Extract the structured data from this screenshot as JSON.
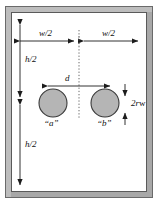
{
  "figure": {
    "name": "well-doublet-domain-diagram",
    "background_color": "#ffffff"
  },
  "frame": {
    "name": "outer-rectangular-boundary",
    "band_color": "#a8a8a8",
    "band_highlight": "#c9c9c9",
    "outline_color": "#4a4a4a",
    "interior_color": "#ffffff"
  },
  "centerline": {
    "name": "vertical-symmetry-axis",
    "style": "dotted",
    "color": "#6b6b6b"
  },
  "wells": [
    {
      "id": "a",
      "label": "“a”",
      "fill": "#b5b5b5",
      "stroke": "#3a3a3a",
      "cx": 53,
      "cy": 103,
      "r": 14
    },
    {
      "id": "b",
      "label": "“b”",
      "fill": "#b5b5b5",
      "stroke": "#3a3a3a",
      "cx": 105,
      "cy": 103,
      "r": 14
    }
  ],
  "dimensions": {
    "width_left": {
      "name": "half-width-left",
      "label": "w/2",
      "symbol": "w",
      "divisor": "2",
      "orientation": "horizontal"
    },
    "width_right": {
      "name": "half-width-right",
      "label": "w/2",
      "symbol": "w",
      "divisor": "2",
      "orientation": "horizontal"
    },
    "height_top": {
      "name": "half-height-top",
      "label": "h/2",
      "symbol": "h",
      "divisor": "2",
      "orientation": "vertical"
    },
    "height_bottom": {
      "name": "half-height-bottom",
      "label": "h/2",
      "symbol": "h",
      "divisor": "2",
      "orientation": "vertical"
    },
    "well_spacing": {
      "name": "well-separation-distance",
      "label": "d",
      "orientation": "horizontal"
    },
    "well_diameter": {
      "name": "well-diameter",
      "label_prefix": "2r",
      "label_subscript": "w",
      "orientation": "vertical"
    }
  },
  "colors": {
    "line": "#1c1c1c",
    "text": "#111111",
    "well_fill": "#b5b5b5",
    "frame_band": "#a8a8a8"
  }
}
